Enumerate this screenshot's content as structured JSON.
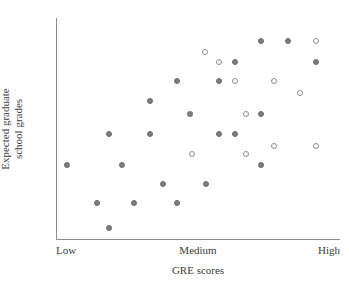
{
  "chart_data": {
    "type": "scatter",
    "title": "",
    "xlabel": "GRE scores",
    "ylabel_line1": "Expected graduate",
    "ylabel_line2": "school grades",
    "ylabel": "Expected graduate school grades",
    "xtick_labels": [
      "Low",
      "Medium",
      "High"
    ],
    "xtick_positions": [
      0,
      50,
      100
    ],
    "ytick_labels": [],
    "xlim": [
      0,
      100
    ],
    "ylim": [
      0,
      100
    ],
    "grid": false,
    "legend": "none",
    "series": [
      {
        "name": "filled-markers",
        "marker": "filled-circle",
        "color": "#7b7b7b",
        "points": [
          {
            "x": 3.9,
            "y": 33.5
          },
          {
            "x": 14.4,
            "y": 16.3
          },
          {
            "x": 18.7,
            "y": 5.0
          },
          {
            "x": 18.7,
            "y": 47.5
          },
          {
            "x": 23.2,
            "y": 33.5
          },
          {
            "x": 27.5,
            "y": 16.3
          },
          {
            "x": 33.1,
            "y": 62.4
          },
          {
            "x": 33.1,
            "y": 47.5
          },
          {
            "x": 37.7,
            "y": 24.9
          },
          {
            "x": 42.6,
            "y": 71.5
          },
          {
            "x": 42.6,
            "y": 16.3
          },
          {
            "x": 47.2,
            "y": 56.6
          },
          {
            "x": 52.8,
            "y": 24.9
          },
          {
            "x": 57.4,
            "y": 71.5
          },
          {
            "x": 57.4,
            "y": 47.5
          },
          {
            "x": 63.0,
            "y": 80.1
          },
          {
            "x": 63.0,
            "y": 47.5
          },
          {
            "x": 72.2,
            "y": 89.6
          },
          {
            "x": 72.2,
            "y": 56.6
          },
          {
            "x": 72.2,
            "y": 33.5
          },
          {
            "x": 81.7,
            "y": 89.6
          },
          {
            "x": 91.5,
            "y": 80.1
          }
        ]
      },
      {
        "name": "open-markers",
        "marker": "open-circle",
        "color": "#8e8e8e",
        "points": [
          {
            "x": 47.2,
            "y": 56.6
          },
          {
            "x": 48.0,
            "y": 38.5
          },
          {
            "x": 52.5,
            "y": 84.6
          },
          {
            "x": 57.4,
            "y": 80.1
          },
          {
            "x": 63.0,
            "y": 71.5
          },
          {
            "x": 67.0,
            "y": 56.6
          },
          {
            "x": 67.0,
            "y": 38.5
          },
          {
            "x": 76.8,
            "y": 71.5
          },
          {
            "x": 86.0,
            "y": 66.0
          },
          {
            "x": 76.8,
            "y": 42.0
          },
          {
            "x": 91.5,
            "y": 42.0
          },
          {
            "x": 91.5,
            "y": 89.6
          }
        ]
      }
    ]
  },
  "colors": {
    "filled_marker": "#7b7b7b",
    "open_marker": "#8e8e8e",
    "axis": "#8d8d8d",
    "text": "#3d3d3d",
    "background": "#ffffff"
  }
}
